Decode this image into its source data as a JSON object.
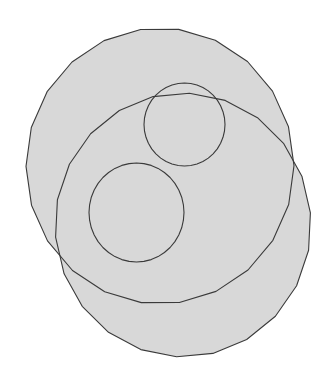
{
  "diagram": {
    "colors": {
      "background": "#ffffff",
      "fill": "#d8d8d8",
      "stroke": "#3a3a3a"
    },
    "shapes": [
      {
        "id": "large-circle-upper-left",
        "kind": "filled-circle"
      },
      {
        "id": "large-circle-lower-right",
        "kind": "filled-circle"
      },
      {
        "id": "small-circle-upper",
        "kind": "outline-circle"
      },
      {
        "id": "small-circle-lower-left",
        "kind": "outline-circle"
      }
    ]
  }
}
